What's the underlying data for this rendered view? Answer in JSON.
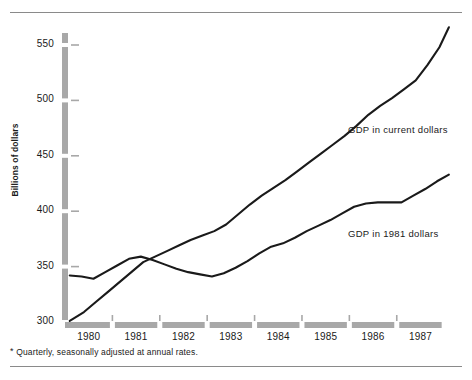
{
  "chart_data": {
    "type": "line",
    "title": "",
    "subtitle": "",
    "xlabel": "",
    "ylabel": "Billions of dollars",
    "ylim": [
      300,
      570
    ],
    "xlim": [
      1979.5,
      1987.75
    ],
    "grid": false,
    "legend_position": "inline-annotation",
    "y_ticks": [
      300,
      350,
      400,
      450,
      500,
      550
    ],
    "y_tick_labels": [
      "300",
      "350",
      "400",
      "450",
      "500",
      "550"
    ],
    "x_ticks": [
      1980,
      1981,
      1982,
      1983,
      1984,
      1985,
      1986,
      1987
    ],
    "x_tick_labels": [
      "1980",
      "1981",
      "1982",
      "1983",
      "1984",
      "1985",
      "1986",
      "1987"
    ],
    "footnote": "Quarterly, seasonally adjusted at annual rates.",
    "footnote_marker": "*",
    "series": [
      {
        "name": "GDP in current dollars",
        "label": "GDP in current dollars",
        "color": "#1a1a1a",
        "x": [
          1979.6,
          1979.9,
          1980.15,
          1980.4,
          1980.65,
          1980.9,
          1981.15,
          1981.4,
          1981.65,
          1981.9,
          1982.15,
          1982.4,
          1982.65,
          1982.9,
          1983.15,
          1983.4,
          1983.65,
          1983.9,
          1984.15,
          1984.4,
          1984.65,
          1984.9,
          1985.15,
          1985.4,
          1985.65,
          1985.9,
          1986.15,
          1986.4,
          1986.65,
          1986.9,
          1987.15,
          1987.4,
          1987.6
        ],
        "values": [
          301,
          309,
          318,
          327,
          336,
          345,
          354,
          359,
          364,
          369,
          374,
          378,
          382,
          388,
          397,
          406,
          414,
          421,
          428,
          436,
          444,
          452,
          460,
          468,
          477,
          487,
          495,
          502,
          510,
          518,
          532,
          548,
          566
        ]
      },
      {
        "name": "GDP in 1981 dollars",
        "label": "GDP in 1981 dollars",
        "color": "#1a1a1a",
        "x": [
          1979.6,
          1979.85,
          1980.1,
          1980.35,
          1980.6,
          1980.85,
          1981.1,
          1981.35,
          1981.6,
          1981.85,
          1982.1,
          1982.35,
          1982.6,
          1982.85,
          1983.1,
          1983.35,
          1983.6,
          1983.85,
          1984.1,
          1984.35,
          1984.6,
          1984.85,
          1985.1,
          1985.35,
          1985.6,
          1985.85,
          1986.1,
          1986.35,
          1986.6,
          1986.85,
          1987.1,
          1987.35,
          1987.6
        ],
        "values": [
          342,
          341,
          339,
          345,
          351,
          357,
          359,
          356,
          352,
          348,
          345,
          343,
          341,
          344,
          349,
          355,
          362,
          368,
          371,
          376,
          382,
          387,
          392,
          398,
          404,
          407,
          408,
          408,
          408,
          414,
          420,
          427,
          433
        ]
      }
    ]
  },
  "axis_style": {
    "axis_bar_color": "#a8a8a8",
    "tick_color": "#a8a8a8",
    "line_color": "#1a1a1a"
  }
}
